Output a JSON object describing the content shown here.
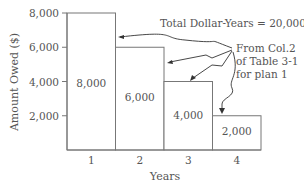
{
  "chart_data": {
    "type": "bar",
    "title": "",
    "xlabel": "Years",
    "ylabel": "Amount Owed ($)",
    "categories": [
      "1",
      "2",
      "3",
      "4"
    ],
    "values": [
      8000,
      6000,
      4000,
      2000
    ],
    "data_labels": [
      "8,000",
      "6,000",
      "4,000",
      "2,000"
    ],
    "ylim": [
      0,
      8000
    ],
    "yticks": [
      2000,
      4000,
      6000,
      8000
    ],
    "ytick_labels": [
      "2,000",
      "4,000",
      "6,000",
      "8,000"
    ],
    "grid": false,
    "annotations": {
      "total": "Total Dollar-Years  = 20,000",
      "source_lines": [
        "From Col.2",
        "of Table 3-1",
        "for plan 1"
      ]
    },
    "colors": {
      "bar_fill": "#ffffff",
      "bar_stroke": "#777777",
      "text": "#555555",
      "arrow": "#333333"
    }
  }
}
